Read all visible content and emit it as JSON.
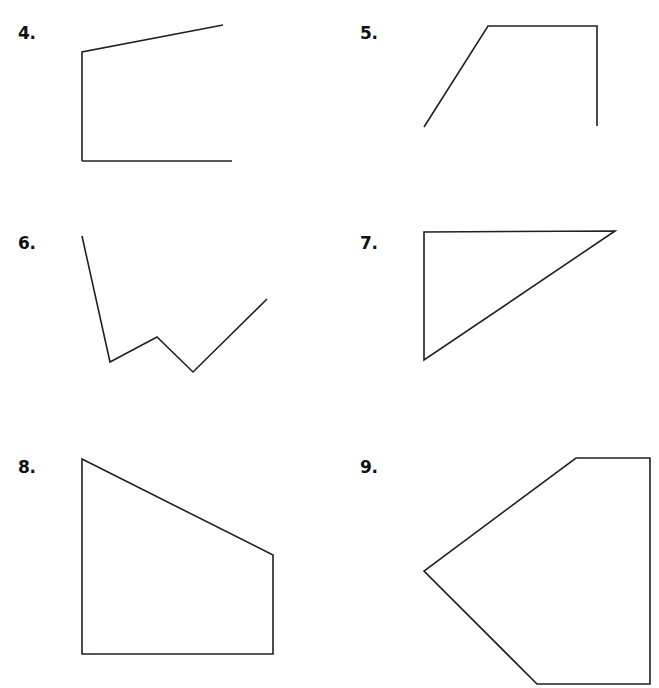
{
  "page": {
    "background_color": "#ffffff",
    "stroke_color": "#231f20",
    "width": 659,
    "height": 688
  },
  "problems": [
    {
      "id": "problem-4",
      "number_label": "4.",
      "number_x": 18,
      "number_y": 25,
      "figure_name": "open-figure-trapezoid-missing-right-side",
      "closed": false,
      "vertices": [
        [
          82,
          161
        ],
        [
          82,
          52
        ],
        [
          223,
          25
        ]
      ],
      "extra_segments": [
        [
          [
            82,
            161
          ],
          [
            232,
            161
          ]
        ]
      ]
    },
    {
      "id": "problem-5",
      "number_label": "5.",
      "number_x": 360,
      "number_y": 25,
      "figure_name": "open-figure-slanted-top-with-right-side",
      "closed": false,
      "vertices": [
        [
          424,
          127
        ],
        [
          488,
          26
        ],
        [
          597,
          26
        ],
        [
          597,
          126
        ]
      ],
      "extra_segments": []
    },
    {
      "id": "problem-6",
      "number_label": "6.",
      "number_x": 18,
      "number_y": 235,
      "figure_name": "open-zigzag-polyline",
      "closed": false,
      "vertices": [
        [
          82,
          236
        ],
        [
          110,
          362
        ],
        [
          157,
          337
        ],
        [
          193,
          372
        ],
        [
          267,
          299
        ]
      ],
      "extra_segments": []
    },
    {
      "id": "problem-7",
      "number_label": "7.",
      "number_x": 360,
      "number_y": 235,
      "figure_name": "closed-right-triangle",
      "closed": true,
      "vertices": [
        [
          424,
          232
        ],
        [
          615,
          231
        ],
        [
          424,
          360
        ]
      ],
      "extra_segments": []
    },
    {
      "id": "problem-8",
      "number_label": "8.",
      "number_x": 18,
      "number_y": 459,
      "figure_name": "closed-quadrilateral-right-trapezoid",
      "closed": true,
      "vertices": [
        [
          82,
          459
        ],
        [
          273,
          555
        ],
        [
          273,
          654
        ],
        [
          82,
          654
        ]
      ],
      "extra_segments": []
    },
    {
      "id": "problem-9",
      "number_label": "9.",
      "number_x": 360,
      "number_y": 459,
      "figure_name": "closed-pentagon-arrowhead",
      "closed": true,
      "vertices": [
        [
          576,
          458
        ],
        [
          650,
          458
        ],
        [
          650,
          684
        ],
        [
          537,
          684
        ],
        [
          424,
          571
        ]
      ],
      "extra_segments": []
    }
  ]
}
